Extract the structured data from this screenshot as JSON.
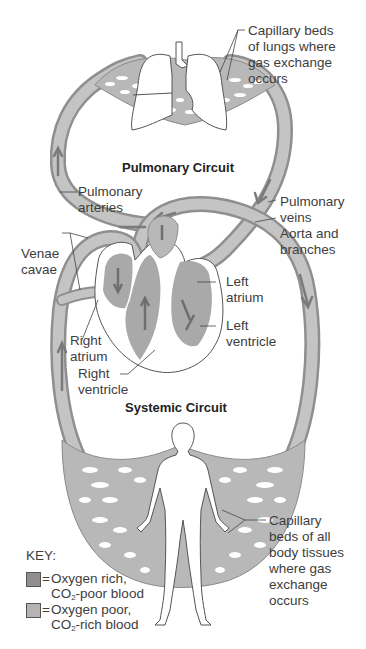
{
  "diagram": {
    "circuits": {
      "pulmonary": "Pulmonary Circuit",
      "systemic": "Systemic Circuit"
    },
    "labels": {
      "capillary_lungs": "Capillary beds\nof lungs where\ngas exchange\noccurs",
      "pulmonary_arteries": "Pulmonary\narteries",
      "pulmonary_veins": "Pulmonary\nveins",
      "aorta": "Aorta and\nbranches",
      "venae_cavae": "Venae\ncavae",
      "left_atrium": "Left\natrium",
      "left_ventricle": "Left\nventricle",
      "right_atrium": "Right\natrium",
      "right_ventricle": "Right\nventricle",
      "capillary_body": "Capillary\nbeds of all\nbody tissues\nwhere gas\nexchange\noccurs"
    },
    "key": {
      "title": "KEY:",
      "items": [
        {
          "eq": "=",
          "line1": "Oxygen rich,",
          "line2_pre": "CO",
          "line2_sub": "2",
          "line2_post": "-poor blood",
          "color": "#8f8f8f"
        },
        {
          "eq": "=",
          "line1": "Oxygen poor,",
          "line2_pre": "CO",
          "line2_sub": "2",
          "line2_post": "-rich blood",
          "color": "#b4b4b4"
        }
      ]
    },
    "colors": {
      "vessel": "#bdbdbd",
      "vessel_edge": "#8a8a8a",
      "arrow": "#7a7a7a",
      "heart": "#a9a9a9"
    }
  }
}
